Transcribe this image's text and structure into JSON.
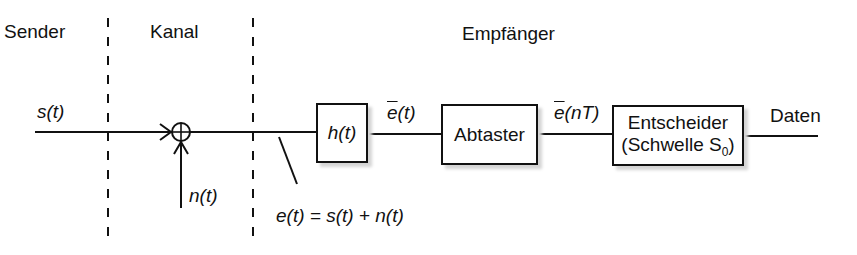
{
  "sections": {
    "sender": "Sender",
    "channel": "Kanal",
    "receiver": "Empfänger"
  },
  "signals": {
    "input": "s(t)",
    "noise": "n(t)",
    "received": "e(t) = s(t) + n(t)",
    "filtered_fn": "e",
    "filtered_arg": "(t)",
    "sampled_fn": "e",
    "sampled_arg": "(nT)",
    "output": "Daten"
  },
  "blocks": {
    "filter": "h(t)",
    "sampler": "Abtaster",
    "decider_line1": "Entscheider",
    "decider_line2": "(Schwelle S",
    "decider_sub": "0",
    "decider_close": ")"
  }
}
